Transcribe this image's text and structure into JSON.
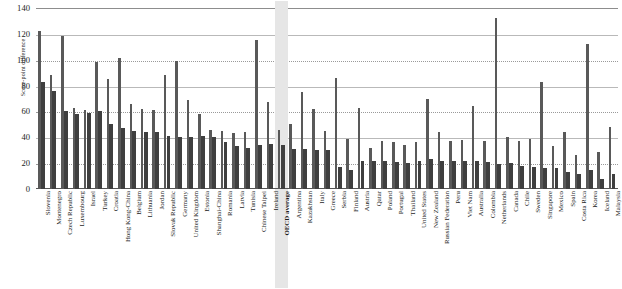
{
  "chart_data": {
    "type": "bar",
    "title": "",
    "xlabel": "",
    "ylabel": "Score-point difference",
    "ylim": [
      0,
      140
    ],
    "yticks": [
      0,
      20,
      40,
      60,
      80,
      100,
      120,
      140
    ],
    "grid": true,
    "legend_position": "none",
    "highlight_category": "OECD average",
    "categories": [
      "Slovenia",
      "Montenegro",
      "Czech Republic",
      "Luxembourg",
      "Israel",
      "Turkey",
      "Croatia",
      "Hong Kong-China",
      "Belgium",
      "Lithuania",
      "Jordan",
      "Slovak Republic",
      "Germany",
      "United Kingdom",
      "Estonia",
      "Shanghai-China",
      "Romania",
      "Latvia",
      "Tunisia",
      "Chinese Taipei",
      "Ireland",
      "OECD average",
      "Argentina",
      "Kazakhstan",
      "Italy",
      "Greece",
      "Serbia",
      "Finland",
      "Austria",
      "Qatar",
      "Poland",
      "Portugal",
      "Thailand",
      "United States",
      "New Zealand",
      "Russian Federation",
      "Peru",
      "Viet Nam",
      "Australia",
      "Colombia",
      "Netherlands",
      "Canada",
      "Chile",
      "Sweden",
      "Singapore",
      "Mexico",
      "Spain",
      "Costa Rica",
      "Korea",
      "Iceland",
      "Malaysia"
    ],
    "series": [
      {
        "name": "Largest score-point difference",
        "values": [
          122,
          88,
          118,
          63,
          61,
          98,
          85,
          101,
          66,
          62,
          61,
          88,
          99,
          69,
          58,
          46,
          45,
          43,
          44,
          115,
          67,
          46,
          50,
          75,
          62,
          45,
          86,
          39,
          63,
          32,
          37,
          36,
          34,
          36,
          70,
          44,
          37,
          38,
          64,
          37,
          132,
          40,
          37,
          39,
          83,
          33,
          44,
          26,
          112,
          29,
          48
        ]
      },
      {
        "name": "Score-point difference",
        "values": [
          83,
          76,
          60,
          58,
          59,
          60,
          50,
          47,
          45,
          44,
          44,
          41,
          40,
          40,
          41,
          40,
          36,
          33,
          32,
          34,
          35,
          34,
          31,
          31,
          30,
          30,
          17,
          15,
          22,
          22,
          22,
          21,
          20,
          22,
          23,
          22,
          22,
          22,
          22,
          21,
          19,
          20,
          18,
          17,
          16,
          16,
          13,
          12,
          15,
          8,
          12
        ]
      }
    ]
  }
}
